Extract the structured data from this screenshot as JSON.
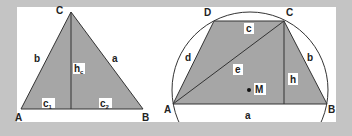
{
  "colors": {
    "background": "#c4c4c4",
    "panel": "#ffffff",
    "fill": "#a6a6a6",
    "stroke": "#333333",
    "label_bg": "#ffffff",
    "text": "#222222"
  },
  "left_figure": {
    "name": "Triangle with altitude",
    "vertices": {
      "A": "A",
      "B": "B",
      "C": "C"
    },
    "sides": {
      "a": "a",
      "b": "b"
    },
    "altitude": {
      "main": "h",
      "sub": "c"
    },
    "segments": [
      {
        "main": "c",
        "sub": "1"
      },
      {
        "main": "c",
        "sub": "2"
      }
    ]
  },
  "right_figure": {
    "name": "Cyclic trapezoid in circumcircle",
    "vertices": {
      "A": "A",
      "B": "B",
      "C": "C",
      "D": "D"
    },
    "sides": {
      "a": "a",
      "b": "b",
      "c": "c",
      "d": "d"
    },
    "diagonal": "e",
    "height": "h",
    "center": "M"
  }
}
